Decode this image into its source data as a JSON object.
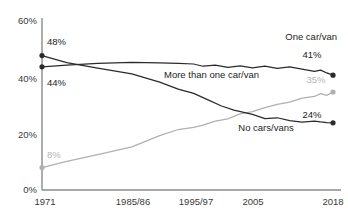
{
  "chart_data": {
    "type": "line",
    "title": "",
    "subtitle": "",
    "xlabel": "",
    "ylabel": "",
    "ylim": [
      0,
      60
    ],
    "y_ticks": [
      0,
      20,
      40,
      60
    ],
    "y_tick_labels": [
      "0%",
      "20%",
      "40%",
      "60%"
    ],
    "x_tick_labels": [
      "1971",
      "1985/86",
      "1995/97",
      "2005",
      "2018"
    ],
    "x_tick_values": [
      1971,
      1985.5,
      1995.5,
      2005,
      2018
    ],
    "xlim": [
      1971,
      2018
    ],
    "grid": false,
    "legend": "inline-annotations",
    "series": [
      {
        "name": "No cars/vans",
        "color": "#2b2b2b",
        "start_label": "48%",
        "end_label": "24%",
        "start_value": 48,
        "end_value": 24,
        "x": [
          1971,
          1975,
          1980,
          1985.5,
          1990,
          1993,
          1995.5,
          1998,
          2000,
          2002,
          2005,
          2007,
          2009,
          2011,
          2013,
          2015,
          2016,
          2017,
          2018
        ],
        "values": [
          48,
          45.5,
          43.5,
          41.5,
          38.5,
          36,
          34.5,
          32,
          30,
          28.5,
          27,
          25.5,
          25.8,
          24.8,
          24.2,
          24.6,
          24.3,
          24.1,
          24
        ]
      },
      {
        "name": "One car/van",
        "color": "#2b2b2b",
        "start_label": "44%",
        "end_label": "41%",
        "start_value": 44,
        "end_value": 41,
        "x": [
          1971,
          1975,
          1980,
          1985.5,
          1990,
          1993,
          1995.5,
          1997,
          1999,
          2001,
          2003,
          2005,
          2007,
          2009,
          2011,
          2013,
          2015,
          2016,
          2017,
          2018
        ],
        "values": [
          44,
          44.6,
          45.2,
          45.6,
          45.4,
          45.2,
          45.0,
          44.2,
          44.6,
          43.8,
          44.3,
          43.6,
          44.2,
          43.4,
          44.0,
          43.2,
          42.4,
          42.8,
          41.8,
          41
        ]
      },
      {
        "name": "More than one car/van",
        "color": "#b0b0b0",
        "start_label": "8%",
        "end_label": "35%",
        "start_value": 8,
        "end_value": 35,
        "x": [
          1971,
          1975,
          1980,
          1985.5,
          1990,
          1993,
          1995.5,
          1997,
          1999,
          2001,
          2003,
          2005,
          2007,
          2009,
          2011,
          2013,
          2015,
          2016,
          2017,
          2018
        ],
        "values": [
          8,
          10.2,
          12.6,
          15.4,
          19.4,
          21.6,
          22.4,
          23.2,
          24.6,
          25.4,
          27.2,
          28.0,
          29.4,
          30.6,
          31.4,
          32.8,
          33.4,
          34.4,
          33.8,
          35
        ]
      }
    ],
    "annotations": [
      {
        "text": "One car/van",
        "series": "One car/van"
      },
      {
        "text": "More than one car/van",
        "series": "More than one car/van"
      },
      {
        "text": "No cars/vans",
        "series": "No cars/vans"
      }
    ]
  }
}
